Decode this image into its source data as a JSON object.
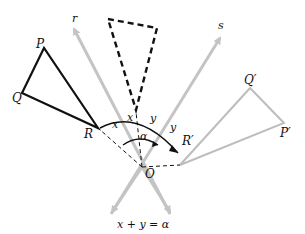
{
  "diagram": {
    "labels": {
      "r": "r",
      "s": "s",
      "P": "P",
      "Q": "Q",
      "R": "R",
      "P_prime": "P′",
      "Q_prime": "Q′",
      "R_prime": "R′",
      "O": "O",
      "x1": "x",
      "x2": "x",
      "y1": "y",
      "y2": "y",
      "alpha": "α",
      "equation": "x + y = α"
    },
    "colors": {
      "line_gray": "#c4c4c4",
      "triangle_black": "#111111",
      "triangle_gray": "#bdbdbd"
    }
  }
}
